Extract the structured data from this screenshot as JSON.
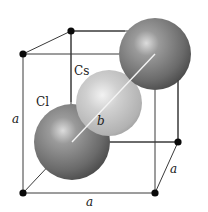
{
  "diagram": {
    "labels": {
      "cs": "Cs",
      "cl": "Cl",
      "body_diagonal": "b",
      "edge_left": "a",
      "edge_bottom": "a",
      "edge_depth": "a"
    },
    "colors": {
      "cl_sphere_dark": "#4a4a4a",
      "cl_sphere_mid": "#8a8a8a",
      "cl_sphere_highlight": "#d8d8d8",
      "cs_sphere_dark": "#9a9a9a",
      "cs_sphere_mid": "#c6c6c6",
      "cs_sphere_highlight": "#f2f2f2",
      "edge": "#3a3a3a",
      "node": "#0a0a0a",
      "diagonal": "#f4f4f4"
    },
    "nodes": [
      {
        "name": "front-top-left",
        "x": 23,
        "y": 54
      },
      {
        "name": "back-top-left",
        "x": 71,
        "y": 31
      },
      {
        "name": "back-bottom-right",
        "x": 178,
        "y": 142
      },
      {
        "name": "front-bottom-left",
        "x": 23,
        "y": 193
      },
      {
        "name": "front-bottom-right",
        "x": 155,
        "y": 193
      }
    ],
    "spheres": [
      {
        "name": "cl-top-right",
        "type": "Cl",
        "cx": 155,
        "cy": 54,
        "r": 36
      },
      {
        "name": "cs-center",
        "type": "Cs",
        "cx": 109,
        "cy": 103,
        "r": 33
      },
      {
        "name": "cl-bottom-left",
        "type": "Cl",
        "cx": 72,
        "cy": 142,
        "r": 38
      }
    ]
  }
}
